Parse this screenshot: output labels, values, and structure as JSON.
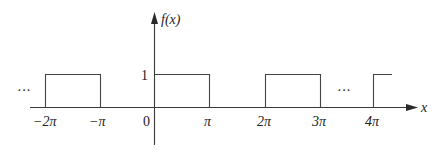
{
  "chart_data": {
    "type": "line",
    "title": "",
    "function_label": "f(x)",
    "xlabel": "x",
    "ylabel": "f(x)",
    "x_tick_labels": [
      "−2π",
      "−π",
      "0",
      "π",
      "2π",
      "3π",
      "4π"
    ],
    "x_tick_values": [
      -6.2832,
      -3.1416,
      0,
      3.1416,
      6.2832,
      9.4248,
      12.5664
    ],
    "y_tick_labels": [
      "1"
    ],
    "y_tick_values": [
      1
    ],
    "series": [
      {
        "name": "f(x)",
        "segments": [
          {
            "x_start": "-2π",
            "x_end": "-π",
            "y": 1
          },
          {
            "x_start": "0",
            "x_end": "π",
            "y": 1
          },
          {
            "x_start": "2π",
            "x_end": "3π",
            "y": 1
          },
          {
            "x_start": "4π",
            "x_end": "4π+ (continues)",
            "y": 1
          }
        ]
      }
    ],
    "annotations": [
      "…",
      "…"
    ],
    "xlim": [
      "-2.3π",
      "4.7π"
    ],
    "ylim": [
      -0.75,
      1.9
    ],
    "grid": false,
    "legend": "none"
  },
  "labels": {
    "ylabel": "f(x)",
    "xlabel": "x",
    "y_one": "1",
    "ellipsis_left": "···",
    "ellipsis_right": "···",
    "ticks": [
      "−2π",
      "−π",
      "0",
      "π",
      "2π",
      "3π",
      "4π"
    ]
  }
}
